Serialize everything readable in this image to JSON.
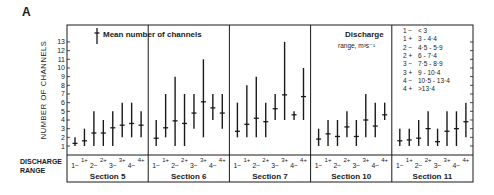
{
  "panel_label": "A",
  "legend": {
    "mean_symbol_label": "Mean number of channels",
    "discharge_title_line1": "Discharge",
    "discharge_title_line2": "range, m³s⁻¹",
    "ranges": [
      {
        "code": "1 −",
        "range": "< 3"
      },
      {
        "code": "1 +",
        "range": "3 - 4·4"
      },
      {
        "code": "2 −",
        "range": "4·5 - 5·9"
      },
      {
        "code": "2 +",
        "range": "6 - 7·4"
      },
      {
        "code": "3 −",
        "range": "7·5 - 8·9"
      },
      {
        "code": "3 +",
        "range": "9 - 10·4"
      },
      {
        "code": "4 −",
        "range": "10·5 - 13·4"
      },
      {
        "code": "4 +",
        "range": ">13·4"
      }
    ]
  },
  "axis": {
    "ylabel": "NUMBER OF CHANNELS",
    "xlabel_line1": "DISCHARGE",
    "xlabel_line2": "RANGE",
    "yticks": [
      1,
      2,
      3,
      4,
      5,
      6,
      7,
      8,
      9,
      10,
      11,
      12,
      13
    ]
  },
  "chart_data": {
    "type": "errorbar",
    "title": "",
    "xlabel": "DISCHARGE RANGE",
    "ylabel": "NUMBER OF CHANNELS",
    "ylim": [
      0,
      14
    ],
    "categories": [
      "1−",
      "1+",
      "2−",
      "2+",
      "3−",
      "3+",
      "4−",
      "4+"
    ],
    "series": [
      {
        "name": "Section 5",
        "mean": [
          1.3,
          1.6,
          2.5,
          2.5,
          3.1,
          3.4,
          3.6,
          3.4
        ],
        "min": [
          1,
          1,
          1,
          1,
          1,
          2,
          2,
          2
        ],
        "max": [
          2,
          3,
          5,
          4,
          5,
          6,
          6,
          5
        ]
      },
      {
        "name": "Section 6",
        "mean": [
          1.9,
          3.1,
          3.9,
          3.6,
          4.8,
          6.1,
          5.4,
          4.8
        ],
        "min": [
          1,
          2,
          1,
          1,
          3,
          2,
          4,
          3
        ],
        "max": [
          4,
          7,
          9,
          7,
          7,
          11,
          7,
          7
        ]
      },
      {
        "name": "Section 7",
        "mean": [
          2.7,
          3.5,
          4.2,
          3.8,
          5.3,
          6.9,
          4.6,
          6.7
        ],
        "min": [
          2,
          2,
          2,
          2,
          4,
          4,
          4,
          4
        ],
        "max": [
          6,
          8,
          9,
          6,
          7,
          13,
          5,
          10
        ]
      },
      {
        "name": "Section 10",
        "mean": [
          1.8,
          2.4,
          2.1,
          3.2,
          2.1,
          4.0,
          3.3,
          4.6
        ],
        "min": [
          1,
          1,
          1,
          2,
          1,
          2,
          2,
          4
        ],
        "max": [
          3,
          4,
          4,
          5,
          4,
          7,
          6,
          6
        ]
      },
      {
        "name": "Section 11",
        "mean": [
          1.6,
          1.7,
          1.9,
          3.0,
          1.5,
          2.7,
          3.0,
          3.8
        ],
        "min": [
          1,
          1,
          1,
          1,
          1,
          1,
          1,
          2
        ],
        "max": [
          3,
          3,
          4,
          5,
          3,
          5,
          5,
          6
        ]
      }
    ],
    "legend_position": "inside-top",
    "grid": false
  }
}
